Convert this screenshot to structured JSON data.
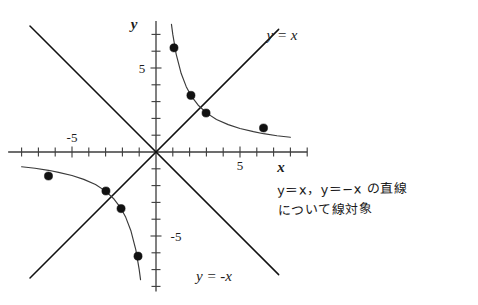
{
  "figure": {
    "title_text": "",
    "axes": {
      "x_label": "x",
      "y_label": "y",
      "x_tick_label_positive": "5",
      "x_tick_label_negative": "-5",
      "y_tick_label_positive": "5",
      "y_tick_label_negative": "-5",
      "x_range": [
        -8.8,
        9.0
      ],
      "y_range": [
        -8.3,
        7.8
      ],
      "tick_step": 1,
      "origin_px": [
        156,
        152
      ],
      "unit_px": 16.8,
      "axis_color": "#3c3c3c"
    },
    "lines": {
      "identity": {
        "label": "y = x",
        "label_x": 282,
        "label_y": 40
      },
      "negative_identity": {
        "label": "y = -x",
        "label_x": 214,
        "label_y": 281
      },
      "color": "#2b2b2b"
    },
    "annotation": {
      "line1": "y＝x，y＝−x の直線",
      "line2": "について線対象"
    }
  },
  "chart_data": {
    "type": "scatter",
    "title": "",
    "xlabel": "x",
    "ylabel": "y",
    "xlim": [
      -8.8,
      9.0
    ],
    "ylim": [
      -8.3,
      7.8
    ],
    "grid": false,
    "legend": "none",
    "series": [
      {
        "name": "y = 7/x (branch 1)",
        "type": "curve-with-points",
        "curve_x": [
          0.92,
          1.0,
          1.2,
          1.5,
          1.8,
          2.1,
          2.5,
          3.0,
          3.6,
          4.3,
          5.0,
          5.8,
          6.4,
          7.2,
          8.0
        ],
        "curve_y": [
          7.6,
          7.0,
          5.83,
          4.67,
          3.89,
          3.33,
          2.8,
          2.33,
          1.94,
          1.63,
          1.4,
          1.21,
          1.09,
          0.97,
          0.88
        ],
        "points": [
          {
            "x": 1.07,
            "y": 6.2
          },
          {
            "x": 2.08,
            "y": 3.37
          },
          {
            "x": 2.98,
            "y": 2.32
          },
          {
            "x": 6.4,
            "y": 1.43
          }
        ]
      },
      {
        "name": "y = 7/x (branch 2)",
        "type": "curve-with-points",
        "curve_x": [
          -0.92,
          -1.0,
          -1.2,
          -1.5,
          -1.8,
          -2.1,
          -2.5,
          -3.0,
          -3.6,
          -4.3,
          -5.0,
          -5.8,
          -6.4,
          -7.2,
          -8.0
        ],
        "curve_y": [
          -7.6,
          -7.0,
          -5.83,
          -4.67,
          -3.89,
          -3.33,
          -2.8,
          -2.33,
          -1.94,
          -1.63,
          -1.4,
          -1.21,
          -1.09,
          -0.97,
          -0.88
        ],
        "points": [
          {
            "x": -1.07,
            "y": -6.2
          },
          {
            "x": -2.08,
            "y": -3.37
          },
          {
            "x": -2.98,
            "y": -2.32
          },
          {
            "x": -6.4,
            "y": -1.43
          }
        ]
      },
      {
        "name": "y = x",
        "type": "line",
        "slope": 1,
        "intercept": 0,
        "x_from": -7.5,
        "x_to": 7.3
      },
      {
        "name": "y = -x",
        "type": "line",
        "slope": -1,
        "intercept": 0,
        "x_from": -7.5,
        "x_to": 7.3
      }
    ],
    "point_color": "#111111",
    "curve_color": "#3a3a3a"
  }
}
